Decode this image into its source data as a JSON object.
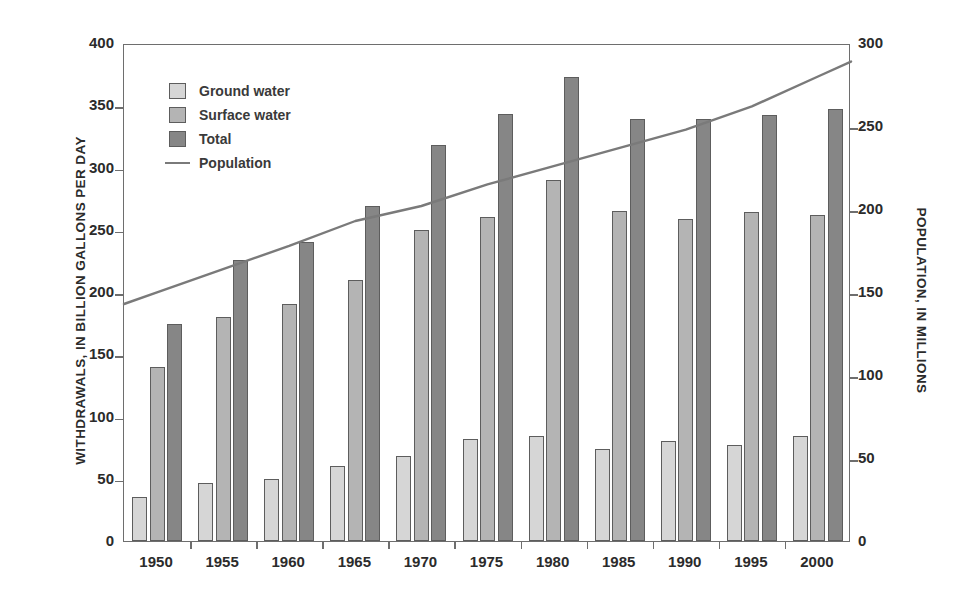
{
  "chart_data": {
    "type": "bar",
    "title": "",
    "subtitle": "",
    "xlabel": "",
    "ylabel": "WITHDRAWALS, IN BILLION GALLONS PER DAY",
    "y2label": "POPULATION, IN MILLIONS",
    "categories": [
      "1950",
      "1955",
      "1960",
      "1965",
      "1970",
      "1975",
      "1980",
      "1985",
      "1990",
      "1995",
      "2000"
    ],
    "ylim": [
      0,
      400
    ],
    "yticks": [
      "0",
      "50",
      "100",
      "150",
      "200",
      "250",
      "300",
      "350",
      "400"
    ],
    "y2lim": [
      0,
      300
    ],
    "y2ticks": [
      "0",
      "50",
      "100",
      "150",
      "200",
      "250",
      "300"
    ],
    "grid": false,
    "legend_position": "upper-left",
    "series": [
      {
        "name": "Ground water",
        "axis": "left",
        "kind": "bar",
        "color": "#d6d6d6",
        "values": [
          35,
          47,
          50,
          60,
          68,
          82,
          84,
          74,
          80,
          77,
          84
        ]
      },
      {
        "name": "Surface water",
        "axis": "left",
        "kind": "bar",
        "color": "#b4b4b4",
        "values": [
          140,
          180,
          190,
          210,
          250,
          260,
          290,
          265,
          259,
          264,
          262
        ]
      },
      {
        "name": "Total",
        "axis": "left",
        "kind": "bar",
        "color": "#868686",
        "values": [
          174,
          226,
          240,
          269,
          318,
          343,
          373,
          339,
          339,
          342,
          347
        ]
      },
      {
        "name": "Population",
        "axis": "right",
        "kind": "line",
        "color": "#7a7a7a",
        "values": [
          151,
          165,
          179,
          194,
          203,
          216,
          227,
          238,
          249,
          263,
          281
        ]
      }
    ]
  },
  "legend": {
    "items": [
      {
        "label": "Ground water",
        "marker": "swatch-light"
      },
      {
        "label": "Surface water",
        "marker": "swatch-medium"
      },
      {
        "label": "Total",
        "marker": "swatch-dark"
      },
      {
        "label": "Population",
        "marker": "line-sample"
      }
    ]
  },
  "colors": {
    "ground_water": "#d6d6d6",
    "surface_water": "#b4b4b4",
    "total": "#868686",
    "population_line": "#7a7a7a",
    "frame": "#6e6e6e",
    "text": "#2b2b2b"
  }
}
